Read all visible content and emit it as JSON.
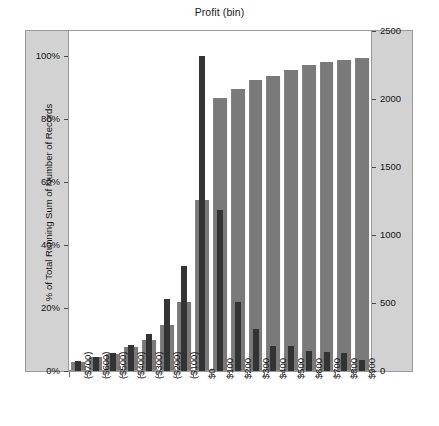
{
  "chart_data": {
    "type": "bar",
    "title": "Profit (bin)",
    "xlabel": "",
    "categories": [
      "($700)",
      "($600)",
      "($500)",
      "($400)",
      "($300)",
      "($200)",
      "($100)",
      "$0",
      "$100",
      "$200",
      "$300",
      "$400",
      "$500",
      "$600",
      "$700",
      "$800",
      "$900"
    ],
    "grid": false,
    "legend": "none",
    "axes": {
      "left": {
        "label": "% of Total Running Sum of Number of Records",
        "ticks": [
          "0%",
          "20%",
          "40%",
          "60%",
          "80%",
          "100%"
        ],
        "tick_values": [
          0,
          20,
          40,
          60,
          80,
          100
        ],
        "min": 0,
        "max": 108
      },
      "right": {
        "label": "Number of Records",
        "ticks": [
          "0",
          "500",
          "1000",
          "1500",
          "2000",
          "2500"
        ],
        "tick_values": [
          0,
          500,
          1000,
          1500,
          2000,
          2500
        ],
        "min": 0,
        "max": 2500
      }
    },
    "series": [
      {
        "name": "Number of Records",
        "axis": "right",
        "color": "#7a7a7a",
        "width_ratio": 0.78,
        "values": [
          68,
          100,
          122,
          175,
          225,
          340,
          505,
          1255,
          2010,
          2075,
          2140,
          2170,
          2215,
          2250,
          2275,
          2290,
          2300
        ]
      },
      {
        "name": "% of Total Running Sum of Number of Records",
        "axis": "left",
        "color": "#333333",
        "width_ratio": 0.34,
        "values": [
          3.2,
          4.6,
          5.8,
          8.2,
          11.6,
          23.0,
          33.4,
          100.0,
          51.0,
          22.0,
          13.4,
          8.0,
          7.8,
          6.4,
          6.0,
          5.8,
          3.6
        ]
      }
    ]
  }
}
